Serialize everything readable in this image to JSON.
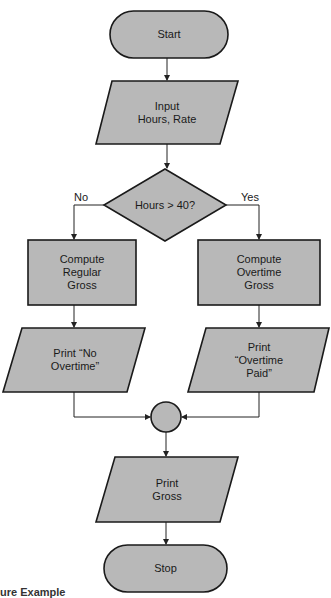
{
  "diagram": {
    "type": "flowchart",
    "colors": {
      "fill": "#b8b8b8",
      "stroke": "#1a1a1a",
      "background": "#ffffff"
    },
    "nodes": {
      "start": {
        "shape": "terminator",
        "label": "Start"
      },
      "input": {
        "shape": "parallelogram",
        "label": "Input\nHours, Rate"
      },
      "decision": {
        "shape": "diamond",
        "label": "Hours > 40?"
      },
      "regular": {
        "shape": "rectangle",
        "label": "Compute\nRegular\nGross"
      },
      "overtime": {
        "shape": "rectangle",
        "label": "Compute\nOvertime\nGross"
      },
      "print_no": {
        "shape": "parallelogram",
        "label": "Print “No\nOvertime”"
      },
      "print_ot": {
        "shape": "parallelogram",
        "label": "Print\n“Overtime\nPaid”"
      },
      "connector": {
        "shape": "circle",
        "label": ""
      },
      "print_gross": {
        "shape": "parallelogram",
        "label": "Print\nGross"
      },
      "stop": {
        "shape": "terminator",
        "label": "Stop"
      }
    },
    "branches": {
      "no": "No",
      "yes": "Yes"
    },
    "edges": [
      [
        "start",
        "input"
      ],
      [
        "input",
        "decision"
      ],
      [
        "decision",
        "regular",
        "No"
      ],
      [
        "decision",
        "overtime",
        "Yes"
      ],
      [
        "regular",
        "print_no"
      ],
      [
        "overtime",
        "print_ot"
      ],
      [
        "print_no",
        "connector"
      ],
      [
        "print_ot",
        "connector"
      ],
      [
        "connector",
        "print_gross"
      ],
      [
        "print_gross",
        "stop"
      ]
    ]
  },
  "caption": "ure Example"
}
